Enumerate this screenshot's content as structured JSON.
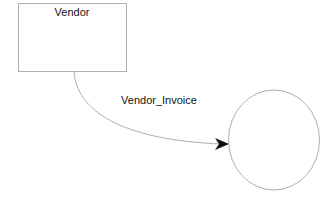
{
  "diagram": {
    "entity": {
      "label": "Vendor"
    },
    "relationship": {
      "label": "Vendor_Invoice"
    },
    "target": {
      "label": ""
    }
  },
  "colors": {
    "stroke": "#b0b0b0",
    "arrow": "#111111",
    "text": "#111111"
  }
}
